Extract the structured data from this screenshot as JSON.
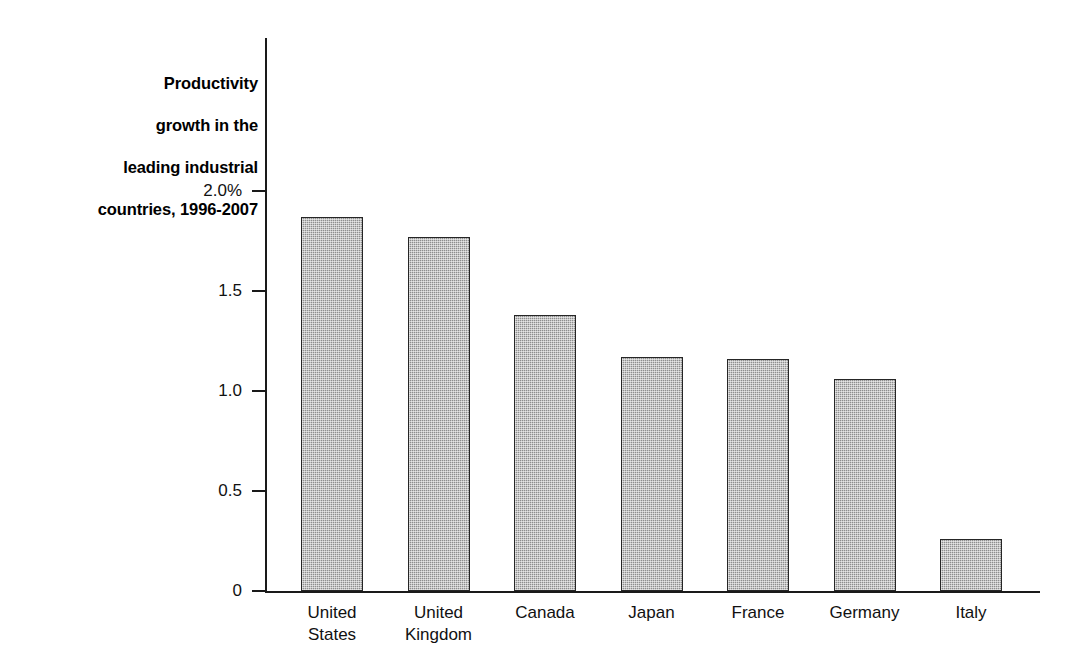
{
  "chart_data": {
    "type": "bar",
    "title": "Productivity growth in the\nleading industrial\ncountries, 1996-2007",
    "title_lines": [
      "Productivity",
      "growth in the",
      "leading industrial",
      "countries, 1996-2007"
    ],
    "xlabel": "",
    "ylabel": "",
    "ylim": [
      0,
      2.0
    ],
    "ytick_values": [
      2.0,
      1.5,
      1.0,
      0.5,
      0
    ],
    "ytick_labels": [
      "2.0%",
      "1.5",
      "1.0",
      "0.5",
      "0"
    ],
    "grid": false,
    "legend": false,
    "units": "percent",
    "categories": [
      "United\nStates",
      "United\nKingdom",
      "Canada",
      "Japan",
      "France",
      "Germany",
      "Italy"
    ],
    "category_labels_flat": [
      "United States",
      "United Kingdom",
      "Canada",
      "Japan",
      "France",
      "Germany",
      "Italy"
    ],
    "values": [
      1.87,
      1.77,
      1.38,
      1.17,
      1.16,
      1.06,
      0.26
    ],
    "bar_fill_color": "#9e9e9e",
    "bar_edge_color": "#262626",
    "axis_color": "#1a1a1a",
    "background_color": "#ffffff"
  }
}
